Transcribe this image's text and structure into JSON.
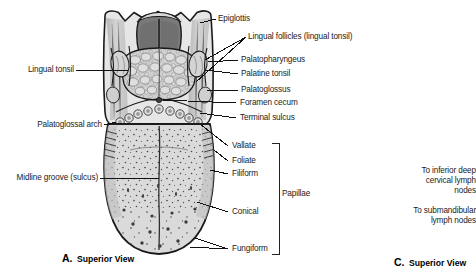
{
  "figure": {
    "background_color": "#ffffff",
    "ink_color": "#1b1b1b",
    "tongue_fill": "#d9d9d9",
    "tongue_shadow": "#b0b0b0",
    "vallecula_dark": "#6e6e6e",
    "outline_color": "#1a1a1a"
  },
  "labels_left": [
    {
      "id": "lingual-tonsil",
      "text": "Lingual tonsil"
    },
    {
      "id": "palatoglossal-arch",
      "text": "Palatoglossal arch"
    },
    {
      "id": "midline-groove",
      "text": "Midline groove (sulcus)"
    }
  ],
  "labels_right": [
    {
      "id": "epiglottis",
      "text": "Epiglottis"
    },
    {
      "id": "lingual-follicles",
      "text": "Lingual follicles (lingual tonsil)"
    },
    {
      "id": "palatopharyngeus",
      "text": "Palatopharyngeus"
    },
    {
      "id": "palatine-tonsil",
      "text": "Palatine tonsil"
    },
    {
      "id": "palatoglossus",
      "text": "Palatoglossus"
    },
    {
      "id": "foramen-cecum",
      "text": "Foramen cecum"
    },
    {
      "id": "terminal-sulcus",
      "text": "Terminal sulcus"
    }
  ],
  "papillae": {
    "group_label": "Papillae",
    "items": [
      {
        "id": "vallate",
        "text": "Vallate"
      },
      {
        "id": "foliate",
        "text": "Foliate"
      },
      {
        "id": "filiform",
        "text": "Filiform"
      },
      {
        "id": "conical",
        "text": "Conical"
      },
      {
        "id": "fungiform",
        "text": "Fungiform"
      }
    ]
  },
  "panel_c": {
    "drainage_notes": [
      {
        "id": "inferior-deep-cervical",
        "lines": [
          "To inferior deep",
          "cervical lymph",
          "nodes"
        ]
      },
      {
        "id": "submandibular",
        "lines": [
          "To submandibular",
          "lymph nodes"
        ]
      }
    ],
    "caption_letter": "C.",
    "caption_text": "Superior View"
  },
  "panel_a": {
    "caption_letter": "A.",
    "caption_text": "Superior View"
  }
}
